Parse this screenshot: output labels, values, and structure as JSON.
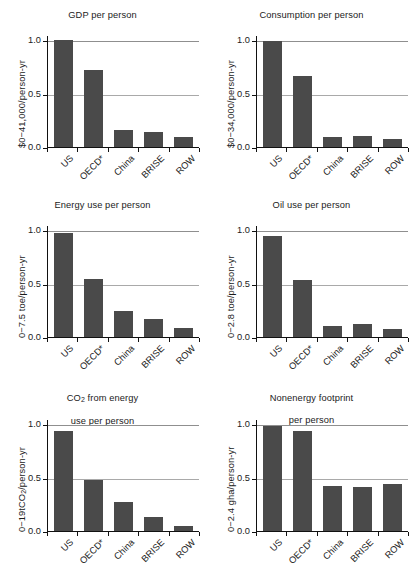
{
  "figure": {
    "categories": [
      "US",
      "OECD*",
      "China",
      "BRISE",
      "ROW"
    ],
    "ytick_labels": [
      "0.0",
      "0.5",
      "1.0"
    ],
    "ytick_values": [
      0.0,
      0.5,
      1.0
    ]
  },
  "chart_data": [
    {
      "type": "bar",
      "title": "GDP per person",
      "ylabel": "$0−41,000/person-yr",
      "xlabel": "",
      "categories": [
        "US",
        "OECD*",
        "China",
        "BRISE",
        "ROW"
      ],
      "values": [
        1.0,
        0.72,
        0.16,
        0.145,
        0.09
      ],
      "ylim": [
        0,
        1.05
      ],
      "yticks": [
        0.0,
        0.5,
        1.0
      ],
      "ytick_labels": [
        "0.0",
        "0.5",
        "1.0"
      ],
      "grid": true,
      "legend": "none"
    },
    {
      "type": "bar",
      "title": "Consumption per person",
      "ylabel": "$0−34,000/person-yr",
      "xlabel": "",
      "categories": [
        "US",
        "OECD*",
        "China",
        "BRISE",
        "ROW"
      ],
      "values": [
        0.99,
        0.67,
        0.09,
        0.1,
        0.075
      ],
      "ylim": [
        0,
        1.05
      ],
      "yticks": [
        0.0,
        0.5,
        1.0
      ],
      "ytick_labels": [
        "0.0",
        "0.5",
        "1.0"
      ],
      "grid": true,
      "legend": "none"
    },
    {
      "type": "bar",
      "title": "Energy use per person",
      "ylabel": "0−7.5 toe/person-yr",
      "xlabel": "",
      "categories": [
        "US",
        "OECD*",
        "China",
        "BRISE",
        "ROW"
      ],
      "values": [
        0.975,
        0.545,
        0.24,
        0.165,
        0.085
      ],
      "ylim": [
        0,
        1.05
      ],
      "yticks": [
        0.0,
        0.5,
        1.0
      ],
      "ytick_labels": [
        "0.0",
        "0.5",
        "1.0"
      ],
      "grid": true,
      "legend": "none"
    },
    {
      "type": "bar",
      "title": "Oil use per person",
      "ylabel": "0−2.8 toe/person-yr",
      "xlabel": "",
      "categories": [
        "US",
        "OECD*",
        "China",
        "BRISE",
        "ROW"
      ],
      "values": [
        0.95,
        0.535,
        0.1,
        0.12,
        0.075
      ],
      "ylim": [
        0,
        1.05
      ],
      "yticks": [
        0.0,
        0.5,
        1.0
      ],
      "ytick_labels": [
        "0.0",
        "0.5",
        "1.0"
      ],
      "grid": true,
      "legend": "none"
    },
    {
      "type": "bar",
      "title": "CO₂ from energy\nuse per person",
      "title_line1": "CO",
      "title_sub": "2",
      "title_rest": " from energy",
      "title_line2": "use per person",
      "ylabel": "0−19tCO₂/person-yr",
      "ylabel_pre": "0−19tCO",
      "ylabel_sub": "2",
      "ylabel_post": "/person-yr",
      "xlabel": "",
      "categories": [
        "US",
        "OECD*",
        "China",
        "BRISE",
        "ROW"
      ],
      "values": [
        0.94,
        0.475,
        0.27,
        0.13,
        0.045
      ],
      "ylim": [
        0,
        1.05
      ],
      "yticks": [
        0.0,
        0.5,
        1.0
      ],
      "ytick_labels": [
        "0.0",
        "0.5",
        "1.0"
      ],
      "grid": true,
      "legend": "none"
    },
    {
      "type": "bar",
      "title": "Nonenergy footprint\nper person",
      "title_line1": "Nonenergy footprint",
      "title_line2": "per person",
      "ylabel": "0−2.4 gha/person-yr",
      "xlabel": "",
      "categories": [
        "US",
        "OECD*",
        "China",
        "BRISE",
        "ROW"
      ],
      "values": [
        0.98,
        0.935,
        0.42,
        0.41,
        0.44
      ],
      "ylim": [
        0,
        1.05
      ],
      "yticks": [
        0.0,
        0.5,
        1.0
      ],
      "ytick_labels": [
        "0.0",
        "0.5",
        "1.0"
      ],
      "grid": true,
      "legend": "none"
    }
  ],
  "colors": {
    "bar_fill": "#4a4a4a",
    "axis": "#111111",
    "gridline": "#a9a9a9",
    "background": "#ffffff",
    "text": "#1b1b1b"
  }
}
